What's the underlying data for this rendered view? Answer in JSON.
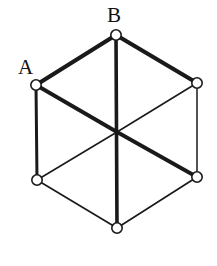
{
  "figure": {
    "type": "graph-diagram",
    "width": 217,
    "height": 266,
    "background_color": "#ffffff",
    "stroke_color": "#1a1a1a",
    "node_fill_color": "#ffffff"
  },
  "labels": {
    "a": "A",
    "b": "B"
  },
  "nodes": [
    {
      "id": "A",
      "name": "vertex-a",
      "label": "A",
      "x": 36,
      "y": 85,
      "r": 5.2
    },
    {
      "id": "B",
      "name": "vertex-b",
      "label": "B",
      "x": 116,
      "y": 35,
      "r": 5.2
    },
    {
      "id": "C",
      "name": "vertex-upper-right",
      "label": "",
      "x": 197,
      "y": 83,
      "r": 5.2
    },
    {
      "id": "D",
      "name": "vertex-lower-right",
      "label": "",
      "x": 197,
      "y": 177,
      "r": 5.2
    },
    {
      "id": "E",
      "name": "vertex-bottom",
      "label": "",
      "x": 117,
      "y": 228,
      "r": 5.2
    },
    {
      "id": "F",
      "name": "vertex-lower-left",
      "label": "",
      "x": 37,
      "y": 180,
      "r": 5.2
    },
    {
      "id": "O",
      "name": "vertex-center",
      "label": "",
      "x": 117,
      "y": 132,
      "r": 0
    }
  ],
  "edges": [
    {
      "name": "edge-a-b",
      "from": "A",
      "to": "B",
      "width": 4.2,
      "kind": "perimeter"
    },
    {
      "name": "edge-b-c",
      "from": "B",
      "to": "C",
      "width": 4.2,
      "kind": "perimeter"
    },
    {
      "name": "edge-c-d",
      "from": "C",
      "to": "D",
      "width": 1.5,
      "kind": "perimeter"
    },
    {
      "name": "edge-d-e",
      "from": "D",
      "to": "E",
      "width": 1.7,
      "kind": "perimeter"
    },
    {
      "name": "edge-e-f",
      "from": "E",
      "to": "F",
      "width": 1.7,
      "kind": "perimeter"
    },
    {
      "name": "edge-f-a",
      "from": "F",
      "to": "A",
      "width": 3.0,
      "kind": "perimeter"
    },
    {
      "name": "diagonal-b-e",
      "from": "B",
      "to": "E",
      "width": 3.6,
      "kind": "diagonal"
    },
    {
      "name": "diagonal-a-o",
      "from": "A",
      "to": "O",
      "width": 3.8,
      "kind": "diagonal-half"
    },
    {
      "name": "diagonal-o-d",
      "from": "O",
      "to": "D",
      "width": 3.8,
      "kind": "diagonal-half"
    },
    {
      "name": "diagonal-c-o",
      "from": "C",
      "to": "O",
      "width": 1.6,
      "kind": "diagonal-half"
    },
    {
      "name": "diagonal-o-f",
      "from": "O",
      "to": "F",
      "width": 1.6,
      "kind": "diagonal-half"
    }
  ]
}
